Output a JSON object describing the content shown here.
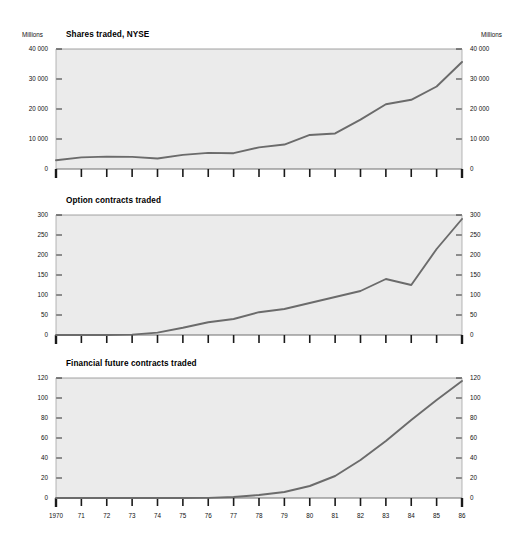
{
  "figure": {
    "background": "#ffffff",
    "plot_background": "#ebebeb",
    "line_color": "#6b6b6b",
    "axis_color": "#1a1a1a"
  },
  "charts": [
    {
      "id": "shares-traded-nyse",
      "title": "Shares traded, NYSE",
      "unit_left": "Millions",
      "unit_right": "Millions",
      "ylabels": [
        "0",
        "10 000",
        "20 000",
        "30 000",
        "40 000"
      ],
      "xlabels_shown": false
    },
    {
      "id": "option-contracts-traded",
      "title": "Option contracts traded",
      "unit_left": "",
      "unit_right": "",
      "ylabels": [
        "0",
        "50",
        "100",
        "150",
        "200",
        "250",
        "300"
      ],
      "xlabels_shown": false
    },
    {
      "id": "financial-future-contracts-traded",
      "title": "Financial future contracts traded",
      "unit_left": "",
      "unit_right": "",
      "ylabels": [
        "0",
        "20",
        "40",
        "60",
        "80",
        "100",
        "120"
      ],
      "xlabels_shown": true
    }
  ],
  "xaxis": {
    "ticklabels": [
      "1970",
      "71",
      "72",
      "73",
      "74",
      "75",
      "76",
      "77",
      "78",
      "79",
      "80",
      "81",
      "82",
      "83",
      "84",
      "85",
      "86"
    ]
  },
  "chart_data": [
    {
      "type": "line",
      "title": "Shares traded, NYSE",
      "xlabel": "",
      "ylabel": "Millions",
      "y_unit": "Millions",
      "grid": false,
      "legend": "none",
      "xlim": [
        1970,
        1986
      ],
      "ylim": [
        0,
        40000
      ],
      "yticks": [
        0,
        10000,
        20000,
        30000,
        40000
      ],
      "ytick_labels": [
        "0",
        "10 000",
        "20 000",
        "30 000",
        "40 000"
      ],
      "x": [
        1970,
        1971,
        1972,
        1973,
        1974,
        1975,
        1976,
        1977,
        1978,
        1979,
        1980,
        1981,
        1982,
        1983,
        1984,
        1985,
        1986
      ],
      "values": [
        2937,
        3891,
        4138,
        4053,
        3518,
        4693,
        5360,
        5274,
        7205,
        8156,
        11352,
        11854,
        16458,
        21590,
        23071,
        27511,
        35680
      ]
    },
    {
      "type": "line",
      "title": "Option contracts traded",
      "xlabel": "",
      "ylabel": "",
      "grid": false,
      "legend": "none",
      "xlim": [
        1970,
        1986
      ],
      "ylim": [
        0,
        300
      ],
      "yticks": [
        0,
        50,
        100,
        150,
        200,
        250,
        300
      ],
      "ytick_labels": [
        "0",
        "50",
        "100",
        "150",
        "200",
        "250",
        "300"
      ],
      "x": [
        1970,
        1971,
        1972,
        1973,
        1974,
        1975,
        1976,
        1977,
        1978,
        1979,
        1980,
        1981,
        1982,
        1983,
        1984,
        1985,
        1986
      ],
      "values": [
        0,
        0,
        0,
        1,
        6,
        18,
        32,
        40,
        57,
        65,
        80,
        95,
        110,
        140,
        125,
        215,
        290
      ]
    },
    {
      "type": "line",
      "title": "Financial future contracts traded",
      "xlabel": "",
      "ylabel": "",
      "grid": false,
      "legend": "none",
      "xlim": [
        1970,
        1986
      ],
      "ylim": [
        0,
        120
      ],
      "yticks": [
        0,
        20,
        40,
        60,
        80,
        100,
        120
      ],
      "ytick_labels": [
        "0",
        "20",
        "40",
        "60",
        "80",
        "100",
        "120"
      ],
      "x": [
        1970,
        1971,
        1972,
        1973,
        1974,
        1975,
        1976,
        1977,
        1978,
        1979,
        1980,
        1981,
        1982,
        1983,
        1984,
        1985,
        1986
      ],
      "values": [
        0,
        0,
        0,
        0,
        0,
        0,
        0.1,
        1,
        3,
        6,
        12,
        22,
        38,
        57,
        78,
        98,
        117
      ]
    }
  ]
}
